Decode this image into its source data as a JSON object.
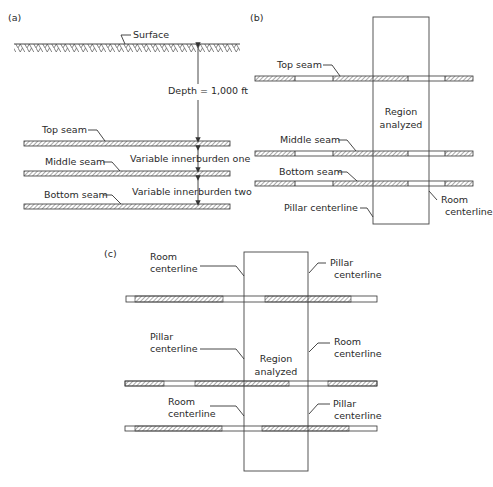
{
  "panel_a": {
    "tag": "(a)",
    "surface_label": "Surface",
    "depth_label": "Depth = 1,000 ft",
    "seams": [
      {
        "label": "Top seam",
        "y": 141
      },
      {
        "label": "Middle seam",
        "y": 171
      },
      {
        "label": "Bottom seam",
        "y": 204
      }
    ],
    "innerburden_one": "Variable innerburden one",
    "innerburden_two": "Variable innerburden two"
  },
  "panel_b": {
    "tag": "(b)",
    "seams": [
      {
        "label": "Top seam",
        "y": 76
      },
      {
        "label": "Middle seam",
        "y": 151
      },
      {
        "label": "Bottom seam",
        "y": 181
      }
    ],
    "region_label_1": "Region",
    "region_label_2": "analyzed",
    "pillar_centerline": "Pillar centerline",
    "room_centerline_1": "Room",
    "room_centerline_2": "centerline"
  },
  "panel_c": {
    "tag": "(c)",
    "region_label_1": "Region",
    "region_label_2": "analyzed",
    "callouts": [
      {
        "l1": "Room",
        "l2": "centerline"
      },
      {
        "l1": "Pillar",
        "l2": "centerline"
      },
      {
        "l1": "Pillar",
        "l2": "centerline"
      },
      {
        "l1": "Room",
        "l2": "centerline"
      },
      {
        "l1": "Room",
        "l2": "centerline"
      },
      {
        "l1": "Pillar",
        "l2": "centerline"
      }
    ]
  }
}
